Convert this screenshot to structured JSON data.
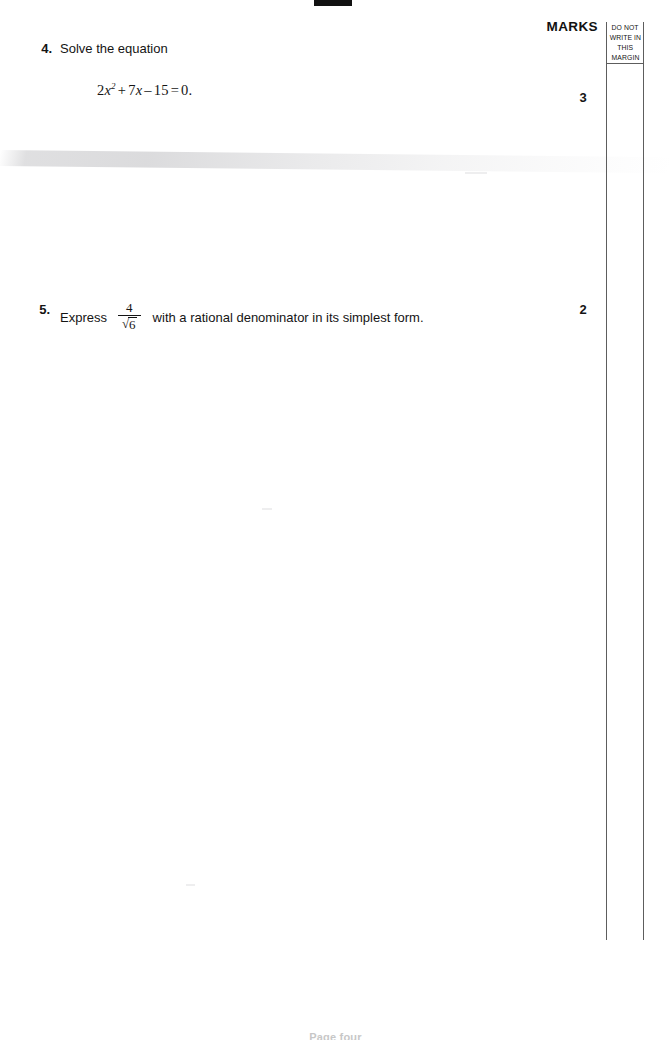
{
  "page": {
    "marks_header": "MARKS",
    "margin_note_lines": [
      "DO NOT",
      "WRITE IN",
      "THIS",
      "MARGIN"
    ],
    "footer_text": "Page four",
    "ink_color": "#141414",
    "rule_color": "#5d5d5d",
    "background": "#ffffff"
  },
  "questions": [
    {
      "number": "4.",
      "prompt": "Solve the equation",
      "equation": {
        "coefficient_a": "2",
        "var": "x",
        "exponent": "2",
        "op1": "+",
        "coefficient_b": "7",
        "var2": "x",
        "op2": "–",
        "constant": "15",
        "equals": "=",
        "rhs": "0",
        "terminator": ".",
        "plain": "2x² + 7x – 15 = 0."
      },
      "marks": "3"
    },
    {
      "number": "5.",
      "prompt_before": "Express",
      "fraction": {
        "numerator": "4",
        "radical_sign": "√",
        "radicand": "6",
        "plain": "4/√6"
      },
      "prompt_after": "with a rational denominator in its simplest form.",
      "marks": "2"
    }
  ]
}
